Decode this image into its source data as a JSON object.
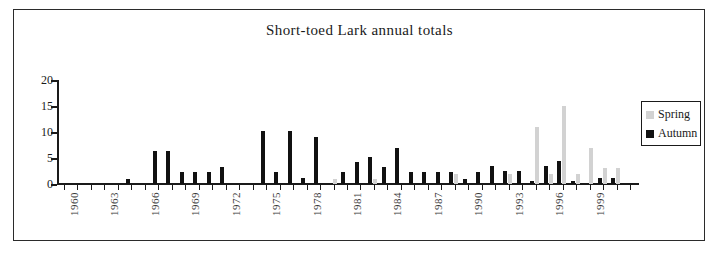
{
  "frame": {
    "border_color": "#2b2b2b",
    "background": "#ffffff"
  },
  "chart_data": {
    "type": "bar",
    "title": "Short-toed Lark annual totals",
    "xlabel": "",
    "ylabel": "",
    "ylim": [
      0,
      20
    ],
    "yticks": [
      0,
      5,
      10,
      15,
      20
    ],
    "grid": false,
    "legend_position": "right",
    "bar_orientation": "vertical",
    "series": [
      {
        "name": "Spring",
        "color": "#d2d2d2",
        "values": [
          0,
          0,
          0,
          0,
          0,
          0,
          0,
          0,
          0,
          0,
          0,
          0,
          0,
          0,
          0,
          0,
          0,
          0,
          0,
          0,
          1,
          0,
          0,
          1,
          0,
          0,
          0,
          0,
          0,
          2,
          0,
          0,
          0,
          2,
          0,
          11,
          2,
          15,
          2,
          7,
          3,
          3,
          0
        ]
      },
      {
        "name": "Autumn",
        "color": "#111111",
        "values": [
          0,
          0,
          0,
          0,
          0,
          1,
          0,
          6.3,
          6.3,
          2.3,
          2.3,
          2.3,
          3.3,
          0,
          0,
          10.2,
          2.4,
          10.2,
          1.2,
          9,
          0,
          2.4,
          4.3,
          5.1,
          3.3,
          7,
          2.4,
          2.4,
          2.4,
          2.4,
          1,
          2.4,
          3.4,
          2.5,
          2.5,
          0.5,
          3.5,
          4.4,
          0.5,
          0,
          1.2,
          1.2,
          0
        ]
      }
    ],
    "categories": [
      1960,
      1961,
      1962,
      1963,
      1964,
      1965,
      1966,
      1967,
      1968,
      1969,
      1970,
      1971,
      1972,
      1973,
      1974,
      1975,
      1976,
      1977,
      1978,
      1979,
      1980,
      1981,
      1982,
      1983,
      1984,
      1985,
      1986,
      1987,
      1988,
      1989,
      1990,
      1991,
      1992,
      1993,
      1994,
      1995,
      1996,
      1997,
      1998,
      1999,
      2000,
      2001,
      2002
    ],
    "xtick_labels": [
      "1960",
      "1963",
      "1966",
      "1969",
      "1972",
      "1975",
      "1978",
      "1981",
      "1984",
      "1987",
      "1990",
      "1993",
      "1996",
      "1999"
    ],
    "xtick_label_rotation": 90
  },
  "legend": {
    "entries": [
      {
        "label": "Spring",
        "color": "#d2d2d2"
      },
      {
        "label": "Autumn",
        "color": "#111111"
      }
    ]
  }
}
